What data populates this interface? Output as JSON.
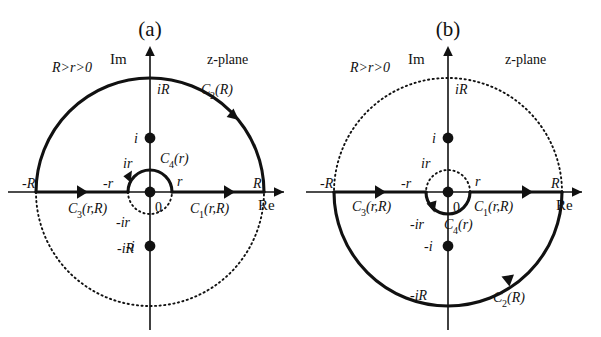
{
  "figure": {
    "background_color": "#ffffff",
    "stroke_color": "#111111"
  },
  "panels": [
    {
      "id": "a",
      "caption": "(a)",
      "condition_label": "R>r>0",
      "plane_label": "z-plane",
      "axis": {
        "imaginary_label": "Im",
        "real_label": "Re",
        "origin_label": "0"
      },
      "ticks": {
        "neg_R": "-R",
        "pos_R": "R",
        "neg_r": "-r",
        "pos_r": "r",
        "i_R": "iR",
        "neg_i_R": "-iR",
        "i_r": "ir",
        "neg_i_r": "-ir",
        "pole_upper": "i",
        "pole_lower": "-i"
      },
      "contours": [
        {
          "name": "C2",
          "label": "C₂(R)",
          "label_base": "C",
          "label_sub": "2",
          "label_arg": "(R)",
          "style": "solid",
          "arc": "upper-large",
          "direction": "counterclockwise"
        },
        {
          "name": "C4",
          "label": "C₄(r)",
          "label_base": "C",
          "label_sub": "4",
          "label_arg": "(r)",
          "style": "solid",
          "arc": "upper-small",
          "direction": "counterclockwise"
        },
        {
          "name": "C1",
          "label": "C₁(r,R)",
          "label_base": "C",
          "label_sub": "1",
          "label_arg": "(r,R)",
          "style": "solid",
          "arc": "segment-right",
          "direction": "rightward"
        },
        {
          "name": "C3",
          "label": "C₃(r,R)",
          "label_base": "C",
          "label_sub": "3",
          "label_arg": "(r,R)",
          "style": "solid",
          "arc": "segment-left",
          "direction": "rightward"
        }
      ],
      "dashed_arcs": [
        "lower-large",
        "lower-small"
      ],
      "poles": [
        {
          "label": "i",
          "position": "upper-imaginary-axis"
        },
        {
          "label": "-i",
          "position": "lower-imaginary-axis"
        },
        {
          "label": "0",
          "position": "origin"
        }
      ]
    },
    {
      "id": "b",
      "caption": "(b)",
      "condition_label": "R>r>0",
      "plane_label": "z-plane",
      "axis": {
        "imaginary_label": "Im",
        "real_label": "Re",
        "origin_label": "0"
      },
      "ticks": {
        "neg_R": "-R",
        "pos_R": "R",
        "neg_r": "-r",
        "pos_r": "r",
        "i_R": "iR",
        "neg_i_R": "-iR",
        "i_r": "ir",
        "neg_i_r": "-ir",
        "pole_upper": "i",
        "pole_lower": "-i"
      },
      "contours": [
        {
          "name": "C2",
          "label": "C₂(R)",
          "label_base": "C",
          "label_sub": "2",
          "label_arg": "(R)",
          "style": "solid",
          "arc": "lower-large",
          "direction": "clockwise"
        },
        {
          "name": "C4",
          "label": "C₄(r)",
          "label_base": "C",
          "label_sub": "4",
          "label_arg": "(r)",
          "style": "solid",
          "arc": "lower-small",
          "direction": "clockwise"
        },
        {
          "name": "C1",
          "label": "C₁(r,R)",
          "label_base": "C",
          "label_sub": "1",
          "label_arg": "(r,R)",
          "style": "solid",
          "arc": "segment-right",
          "direction": "rightward"
        },
        {
          "name": "C3",
          "label": "C₃(r,R)",
          "label_base": "C",
          "label_sub": "3",
          "label_arg": "(r,R)",
          "style": "solid",
          "arc": "segment-left",
          "direction": "rightward"
        }
      ],
      "dashed_arcs": [
        "upper-large",
        "upper-small"
      ],
      "poles": [
        {
          "label": "i",
          "position": "upper-imaginary-axis"
        },
        {
          "label": "-i",
          "position": "lower-imaginary-axis"
        },
        {
          "label": "0",
          "position": "origin"
        }
      ]
    }
  ]
}
